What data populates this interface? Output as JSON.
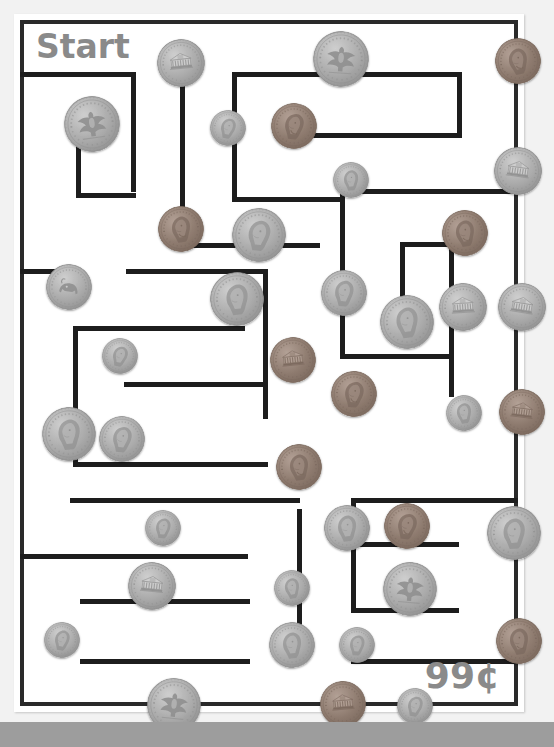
{
  "worksheet": {
    "start_label": "Start",
    "target_amount": "99¢",
    "type": "coin-counting-maze",
    "colors": {
      "paper": "#ffffff",
      "page_background": "#f2f2f2",
      "wall": "#1d1d1d",
      "text": "#8a8a8a",
      "silver_coin": "#b6b6b6",
      "copper_coin": "#9a8a80"
    }
  },
  "maze": {
    "width": 510,
    "height": 698,
    "wall_thickness": 5,
    "border": {
      "x": 6,
      "y": 6,
      "w": 498,
      "h": 686,
      "thickness": 4
    },
    "walls": [
      {
        "x": 6,
        "y": 58,
        "w": 116,
        "h": 5
      },
      {
        "x": 117,
        "y": 58,
        "w": 5,
        "h": 4
      },
      {
        "x": 117,
        "y": 58,
        "w": 5,
        "h": 120
      },
      {
        "x": 62,
        "y": 112,
        "w": 5,
        "h": 72
      },
      {
        "x": 62,
        "y": 179,
        "w": 60,
        "h": 5
      },
      {
        "x": 166,
        "y": 62,
        "w": 5,
        "h": 172
      },
      {
        "x": 166,
        "y": 229,
        "w": 140,
        "h": 5
      },
      {
        "x": 218,
        "y": 58,
        "w": 5,
        "h": 130
      },
      {
        "x": 218,
        "y": 183,
        "w": 108,
        "h": 5
      },
      {
        "x": 218,
        "y": 58,
        "w": 230,
        "h": 5
      },
      {
        "x": 443,
        "y": 58,
        "w": 5,
        "h": 66
      },
      {
        "x": 271,
        "y": 119,
        "w": 177,
        "h": 5
      },
      {
        "x": 326,
        "y": 183,
        "w": 5,
        "h": 52
      },
      {
        "x": 326,
        "y": 175,
        "w": 5,
        "h": 60
      },
      {
        "x": 326,
        "y": 175,
        "w": 178,
        "h": 5
      },
      {
        "x": 326,
        "y": 230,
        "w": 5,
        "h": 115
      },
      {
        "x": 386,
        "y": 228,
        "w": 5,
        "h": 95
      },
      {
        "x": 386,
        "y": 228,
        "w": 54,
        "h": 5
      },
      {
        "x": 435,
        "y": 228,
        "w": 5,
        "h": 155
      },
      {
        "x": 326,
        "y": 340,
        "w": 114,
        "h": 5
      },
      {
        "x": 6,
        "y": 255,
        "w": 62,
        "h": 5
      },
      {
        "x": 112,
        "y": 255,
        "w": 142,
        "h": 5
      },
      {
        "x": 249,
        "y": 255,
        "w": 5,
        "h": 150
      },
      {
        "x": 59,
        "y": 312,
        "w": 5,
        "h": 140
      },
      {
        "x": 59,
        "y": 312,
        "w": 172,
        "h": 5
      },
      {
        "x": 110,
        "y": 368,
        "w": 144,
        "h": 5
      },
      {
        "x": 59,
        "y": 448,
        "w": 195,
        "h": 5
      },
      {
        "x": 56,
        "y": 484,
        "w": 230,
        "h": 5
      },
      {
        "x": 6,
        "y": 540,
        "w": 228,
        "h": 5
      },
      {
        "x": 66,
        "y": 585,
        "w": 170,
        "h": 5
      },
      {
        "x": 66,
        "y": 645,
        "w": 170,
        "h": 5
      },
      {
        "x": 283,
        "y": 495,
        "w": 5,
        "h": 145
      },
      {
        "x": 337,
        "y": 484,
        "w": 5,
        "h": 115
      },
      {
        "x": 337,
        "y": 484,
        "w": 112,
        "h": 5
      },
      {
        "x": 337,
        "y": 528,
        "w": 108,
        "h": 5
      },
      {
        "x": 337,
        "y": 594,
        "w": 108,
        "h": 5
      },
      {
        "x": 337,
        "y": 645,
        "w": 167,
        "h": 5
      },
      {
        "x": 392,
        "y": 484,
        "w": 112,
        "h": 5
      }
    ]
  },
  "coins": [
    {
      "id": "coin-1",
      "type": "nickel",
      "label": "nickel",
      "face": "monticello",
      "x": 143,
      "y": 25,
      "size": 48,
      "rotate": -6
    },
    {
      "id": "coin-2",
      "type": "quarter",
      "label": "quarter",
      "face": "eagle",
      "x": 299,
      "y": 17,
      "size": 56,
      "rotate": 4
    },
    {
      "id": "coin-3",
      "type": "penny",
      "label": "penny",
      "face": "lincoln",
      "x": 481,
      "y": 24,
      "size": 46,
      "rotate": -12
    },
    {
      "id": "coin-4",
      "type": "quarter",
      "label": "quarter",
      "face": "eagle",
      "x": 50,
      "y": 82,
      "size": 56,
      "rotate": -8
    },
    {
      "id": "coin-5",
      "type": "dime",
      "label": "dime",
      "face": "roosevelt",
      "x": 196,
      "y": 96,
      "size": 36,
      "rotate": 10
    },
    {
      "id": "coin-6",
      "type": "penny",
      "label": "penny",
      "face": "lincoln",
      "x": 257,
      "y": 89,
      "size": 46,
      "rotate": 6
    },
    {
      "id": "coin-7",
      "type": "nickel",
      "label": "nickel",
      "face": "monticello",
      "x": 480,
      "y": 133,
      "size": 48,
      "rotate": 8
    },
    {
      "id": "coin-8",
      "type": "dime",
      "label": "dime",
      "face": "roosevelt",
      "x": 319,
      "y": 148,
      "size": 36,
      "rotate": -5
    },
    {
      "id": "coin-9",
      "type": "penny",
      "label": "penny",
      "face": "lincoln",
      "x": 144,
      "y": 192,
      "size": 46,
      "rotate": -8
    },
    {
      "id": "coin-10",
      "type": "quarter",
      "label": "quarter",
      "face": "washington",
      "x": 218,
      "y": 194,
      "size": 54,
      "rotate": 5
    },
    {
      "id": "coin-11",
      "type": "penny",
      "label": "penny",
      "face": "lincoln",
      "x": 428,
      "y": 196,
      "size": 46,
      "rotate": -10
    },
    {
      "id": "coin-12",
      "type": "nickel",
      "label": "nickel",
      "face": "buffalo",
      "x": 32,
      "y": 250,
      "size": 46,
      "rotate": 7
    },
    {
      "id": "coin-13",
      "type": "quarter",
      "label": "quarter",
      "face": "washington",
      "x": 196,
      "y": 258,
      "size": 54,
      "rotate": -6
    },
    {
      "id": "coin-14",
      "type": "nickel",
      "label": "nickel",
      "face": "jefferson",
      "x": 307,
      "y": 256,
      "size": 46,
      "rotate": 3
    },
    {
      "id": "coin-15",
      "type": "nickel",
      "label": "nickel",
      "face": "monticello",
      "x": 425,
      "y": 269,
      "size": 48,
      "rotate": -4
    },
    {
      "id": "coin-16",
      "type": "nickel",
      "label": "nickel",
      "face": "monticello",
      "x": 484,
      "y": 269,
      "size": 48,
      "rotate": 9
    },
    {
      "id": "coin-17",
      "type": "quarter",
      "label": "quarter",
      "face": "washington",
      "x": 366,
      "y": 281,
      "size": 54,
      "rotate": -7
    },
    {
      "id": "coin-18",
      "type": "dime",
      "label": "dime",
      "face": "roosevelt",
      "x": 88,
      "y": 324,
      "size": 36,
      "rotate": 12
    },
    {
      "id": "coin-19",
      "type": "penny",
      "label": "penny",
      "face": "memorial",
      "x": 256,
      "y": 323,
      "size": 46,
      "rotate": -6
    },
    {
      "id": "coin-20",
      "type": "penny",
      "label": "penny",
      "face": "lincoln",
      "x": 317,
      "y": 357,
      "size": 46,
      "rotate": 5
    },
    {
      "id": "coin-21",
      "type": "dime",
      "label": "dime",
      "face": "roosevelt",
      "x": 432,
      "y": 381,
      "size": 36,
      "rotate": -9
    },
    {
      "id": "coin-22",
      "type": "penny",
      "label": "penny",
      "face": "memorial",
      "x": 485,
      "y": 375,
      "size": 46,
      "rotate": 7
    },
    {
      "id": "coin-23",
      "type": "quarter",
      "label": "quarter",
      "face": "washington",
      "x": 28,
      "y": 393,
      "size": 54,
      "rotate": -5
    },
    {
      "id": "coin-24",
      "type": "nickel",
      "label": "nickel",
      "face": "jefferson",
      "x": 85,
      "y": 402,
      "size": 46,
      "rotate": 6
    },
    {
      "id": "coin-25",
      "type": "penny",
      "label": "penny",
      "face": "lincoln",
      "x": 262,
      "y": 430,
      "size": 46,
      "rotate": -8
    },
    {
      "id": "coin-26",
      "type": "dime",
      "label": "dime",
      "face": "roosevelt",
      "x": 131,
      "y": 496,
      "size": 36,
      "rotate": 5
    },
    {
      "id": "coin-27",
      "type": "nickel",
      "label": "nickel",
      "face": "jefferson",
      "x": 310,
      "y": 491,
      "size": 46,
      "rotate": -6
    },
    {
      "id": "coin-28",
      "type": "penny",
      "label": "penny",
      "face": "lincoln",
      "x": 370,
      "y": 489,
      "size": 46,
      "rotate": 8
    },
    {
      "id": "coin-29",
      "type": "quarter",
      "label": "quarter",
      "face": "washington",
      "x": 473,
      "y": 492,
      "size": 54,
      "rotate": -4
    },
    {
      "id": "coin-30",
      "type": "nickel",
      "label": "nickel",
      "face": "monticello",
      "x": 114,
      "y": 548,
      "size": 48,
      "rotate": 6
    },
    {
      "id": "coin-31",
      "type": "dime",
      "label": "dime",
      "face": "roosevelt",
      "x": 260,
      "y": 556,
      "size": 36,
      "rotate": -10
    },
    {
      "id": "coin-32",
      "type": "quarter",
      "label": "quarter",
      "face": "eagle",
      "x": 369,
      "y": 548,
      "size": 54,
      "rotate": 5
    },
    {
      "id": "coin-33",
      "type": "dime",
      "label": "dime",
      "face": "roosevelt",
      "x": 30,
      "y": 608,
      "size": 36,
      "rotate": 8
    },
    {
      "id": "coin-34",
      "type": "nickel",
      "label": "nickel",
      "face": "jefferson",
      "x": 255,
      "y": 608,
      "size": 46,
      "rotate": -7
    },
    {
      "id": "coin-35",
      "type": "dime",
      "label": "dime",
      "face": "roosevelt",
      "x": 325,
      "y": 613,
      "size": 36,
      "rotate": 4
    },
    {
      "id": "coin-36",
      "type": "penny",
      "label": "penny",
      "face": "lincoln",
      "x": 482,
      "y": 604,
      "size": 46,
      "rotate": -9
    },
    {
      "id": "coin-37",
      "type": "quarter",
      "label": "quarter",
      "face": "eagle",
      "x": 133,
      "y": 664,
      "size": 54,
      "rotate": 6
    },
    {
      "id": "coin-38",
      "type": "penny",
      "label": "penny",
      "face": "memorial",
      "x": 306,
      "y": 667,
      "size": 46,
      "rotate": -5
    },
    {
      "id": "coin-39",
      "type": "dime",
      "label": "dime",
      "face": "roosevelt",
      "x": 383,
      "y": 674,
      "size": 36,
      "rotate": 9
    }
  ]
}
